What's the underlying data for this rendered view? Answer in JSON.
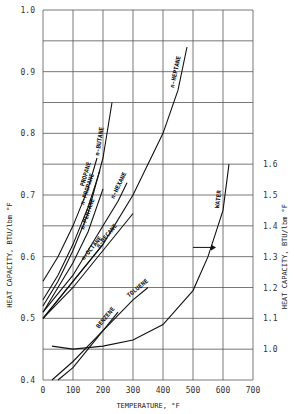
{
  "chart_data": {
    "type": "line",
    "title": "",
    "xlabel": "TEMPERATURE, °F",
    "ylabel": "HEAT CAPACITY, BTU/lbm °F",
    "y2label": "HEAT CAPACITY, BTU/lbm °F",
    "xlim": [
      0,
      700
    ],
    "ylim": [
      0.4,
      1.0
    ],
    "y2lim": [
      1.0,
      1.6
    ],
    "x_ticks": [
      "0",
      "100",
      "200",
      "300",
      "400",
      "500",
      "600",
      "700"
    ],
    "y_ticks": [
      "0.4",
      "0.5",
      "0.6",
      "0.7",
      "0.8",
      "0.9",
      "1.0"
    ],
    "y2_ticks": [
      "1.0",
      "1.1",
      "1.2",
      "1.3",
      "1.4",
      "1.5",
      "1.6"
    ],
    "grid": true,
    "series": [
      {
        "name": "PROPANE",
        "axis": "left",
        "x": [
          0,
          50,
          100,
          150,
          180
        ],
        "y": [
          0.56,
          0.6,
          0.65,
          0.71,
          0.76
        ]
      },
      {
        "name": "n-PROPANE",
        "axis": "left",
        "x": [
          0,
          50,
          100,
          150,
          190
        ],
        "y": [
          0.53,
          0.57,
          0.62,
          0.68,
          0.74
        ]
      },
      {
        "name": "n-BUTANE",
        "axis": "left",
        "x": [
          0,
          50,
          100,
          150,
          200,
          230
        ],
        "y": [
          0.52,
          0.56,
          0.61,
          0.67,
          0.76,
          0.85
        ]
      },
      {
        "name": "n-PENTANE",
        "axis": "left",
        "x": [
          0,
          50,
          100,
          150,
          200
        ],
        "y": [
          0.51,
          0.55,
          0.59,
          0.64,
          0.71
        ]
      },
      {
        "name": "n-HEXANE",
        "axis": "left",
        "x": [
          0,
          50,
          100,
          150,
          200,
          250,
          280
        ],
        "y": [
          0.51,
          0.54,
          0.57,
          0.61,
          0.65,
          0.69,
          0.72
        ]
      },
      {
        "name": "n-HEPTANE",
        "axis": "left",
        "x": [
          0,
          100,
          200,
          300,
          400,
          450,
          480
        ],
        "y": [
          0.5,
          0.56,
          0.62,
          0.7,
          0.8,
          0.87,
          0.94
        ]
      },
      {
        "name": "n-OCTANE",
        "axis": "left",
        "x": [
          0,
          50,
          100,
          150,
          200
        ],
        "y": [
          0.5,
          0.53,
          0.56,
          0.59,
          0.62
        ]
      },
      {
        "name": "n-DECANE",
        "axis": "left",
        "x": [
          0,
          100,
          200,
          300
        ],
        "y": [
          0.5,
          0.55,
          0.61,
          0.67
        ]
      },
      {
        "name": "BENZENE",
        "axis": "left",
        "x": [
          50,
          100,
          150,
          200,
          250
        ],
        "y": [
          0.4,
          0.42,
          0.45,
          0.48,
          0.51
        ]
      },
      {
        "name": "TOLUENE",
        "axis": "left",
        "x": [
          30,
          100,
          200,
          300,
          350
        ],
        "y": [
          0.4,
          0.43,
          0.48,
          0.53,
          0.55
        ]
      },
      {
        "name": "WATER",
        "axis": "right",
        "x": [
          30,
          100,
          200,
          300,
          400,
          500,
          550,
          600,
          620
        ],
        "y": [
          1.01,
          1.0,
          1.01,
          1.03,
          1.08,
          1.19,
          1.3,
          1.45,
          1.6
        ]
      }
    ],
    "annotations": [
      {
        "text": "→ (WATER uses right axis)",
        "x": 560,
        "y2": 1.33
      }
    ]
  }
}
